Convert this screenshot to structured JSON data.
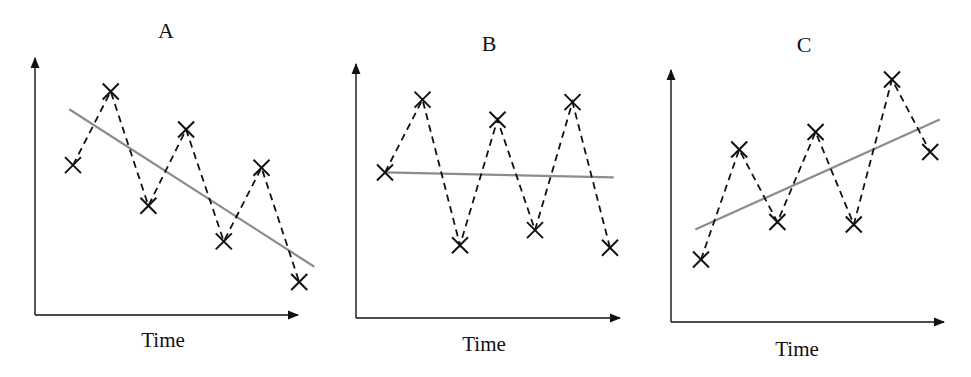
{
  "chart_data": [
    {
      "type": "line",
      "title": "A",
      "xlabel": "Time",
      "ylabel": "",
      "x": [
        1,
        2,
        3,
        4,
        5,
        6,
        7
      ],
      "series": [
        {
          "name": "observations",
          "style": "dashed black with x markers",
          "values": [
            5.9,
            8.8,
            4.3,
            7.3,
            2.9,
            5.8,
            1.3
          ]
        },
        {
          "name": "trend",
          "style": "solid gray",
          "values": [
            8.1,
            1.9
          ],
          "x": [
            0.9,
            7.4
          ]
        }
      ],
      "trend_direction": "decreasing",
      "ylim": [
        0,
        10
      ],
      "grid": false,
      "legend": null
    },
    {
      "type": "line",
      "title": "B",
      "xlabel": "Time",
      "ylabel": "",
      "x": [
        1,
        2,
        3,
        4,
        5,
        6,
        7
      ],
      "series": [
        {
          "name": "observations",
          "style": "dashed black with x markers",
          "values": [
            5.8,
            8.7,
            2.9,
            7.9,
            3.5,
            8.6,
            2.8
          ]
        },
        {
          "name": "trend",
          "style": "solid gray",
          "values": [
            5.8,
            5.6
          ],
          "x": [
            1,
            7.1
          ]
        }
      ],
      "trend_direction": "flat",
      "ylim": [
        0,
        10
      ],
      "grid": false,
      "legend": null
    },
    {
      "type": "line",
      "title": "C",
      "xlabel": "Time",
      "ylabel": "",
      "x": [
        1,
        2,
        3,
        4,
        5,
        6,
        7
      ],
      "series": [
        {
          "name": "observations",
          "style": "dashed black with x markers",
          "values": [
            2.5,
            6.9,
            4.0,
            7.6,
            3.9,
            9.7,
            6.8
          ]
        },
        {
          "name": "trend",
          "style": "solid gray",
          "values": [
            3.7,
            8.1
          ],
          "x": [
            0.85,
            7.25
          ]
        }
      ],
      "trend_direction": "increasing",
      "ylim": [
        0,
        10
      ],
      "grid": false,
      "legend": null
    }
  ],
  "panels": [
    {
      "title": "A",
      "xlabel": "Time"
    },
    {
      "title": "B",
      "xlabel": "Time"
    },
    {
      "title": "C",
      "xlabel": "Time"
    }
  ],
  "colors": {
    "axis": "#111111",
    "data_line": "#111111",
    "trend_line": "#8c8c8c"
  }
}
